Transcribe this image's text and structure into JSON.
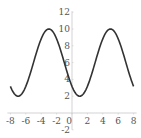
{
  "chart_data": {
    "type": "line",
    "title": "",
    "xlabel": "",
    "ylabel": "",
    "function": "f(x) = 6 + 4*sin(pi*(x+5)/4)",
    "xlim": [
      -8,
      8
    ],
    "ylim": [
      -2,
      12
    ],
    "grid": false,
    "legend": null,
    "x_ticks": [
      -8,
      -6,
      -4,
      -2,
      0,
      2,
      4,
      6,
      8
    ],
    "y_ticks": [
      -2,
      2,
      4,
      6,
      8,
      10,
      12
    ],
    "series": [
      {
        "name": "curve",
        "color": "#333333",
        "x": [
          -8,
          -7,
          -6,
          -5,
          -4,
          -3,
          -2,
          -1,
          0,
          1,
          2,
          3,
          4,
          5,
          6,
          7,
          8
        ],
        "y": [
          3.17,
          2,
          3.17,
          6,
          8.83,
          10,
          8.83,
          6,
          3.17,
          2,
          3.17,
          6,
          8.83,
          10,
          8.83,
          6,
          3.17
        ]
      }
    ],
    "annotations": {
      "maxima": [
        [
          -3,
          10
        ],
        [
          5,
          10
        ]
      ],
      "minima": [
        [
          -7,
          2
        ],
        [
          1,
          2
        ]
      ]
    }
  },
  "axis_color": "#c8c8c8",
  "labels": {
    "x": [
      "-8",
      "-6",
      "-4",
      "-2",
      "0",
      "2",
      "4",
      "6",
      "8"
    ],
    "y": [
      "12",
      "10",
      "8",
      "6",
      "4",
      "2",
      "-2"
    ]
  }
}
